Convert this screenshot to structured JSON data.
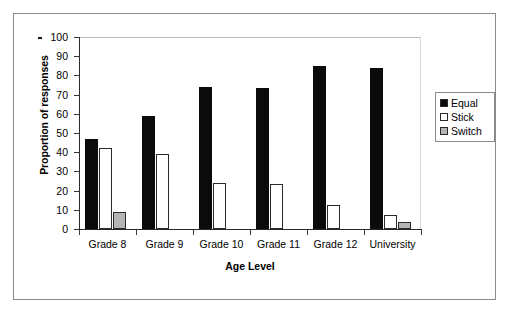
{
  "chart_data": {
    "type": "bar",
    "title": "",
    "xlabel": "Age Level",
    "ylabel": "Proportion of responses",
    "ylim": [
      0,
      100
    ],
    "ytick_interval": 10,
    "yticks": [
      100,
      90,
      80,
      70,
      60,
      50,
      40,
      30,
      20,
      10,
      0
    ],
    "grid": false,
    "legend_position": "right",
    "categories": [
      "Grade 8",
      "Grade 9",
      "Grade 10",
      "Grade 11",
      "Grade 12",
      "University"
    ],
    "series": [
      {
        "name": "Equal",
        "color": "#0b0b0b",
        "values": [
          47,
          59,
          74,
          73.5,
          85,
          84
        ]
      },
      {
        "name": "Stick",
        "color": "#ffffff",
        "values": [
          42,
          39,
          24,
          23.5,
          12.5,
          7.5
        ]
      },
      {
        "name": "Switch",
        "color": "#b5b5b5",
        "values": [
          9,
          0,
          0,
          0,
          0,
          3.5
        ]
      }
    ]
  },
  "legend": {
    "items": [
      {
        "label": "Equal",
        "swatch": "equal"
      },
      {
        "label": "Stick",
        "swatch": "stick"
      },
      {
        "label": "Switch",
        "swatch": "switch"
      }
    ]
  }
}
